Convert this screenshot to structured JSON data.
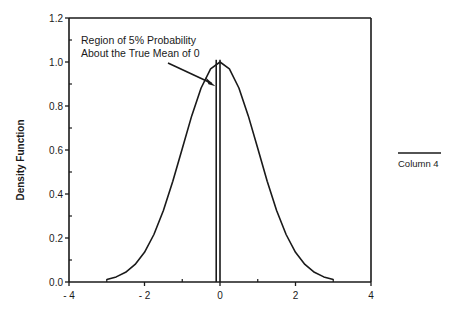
{
  "chart_data": {
    "type": "line",
    "title": "",
    "xlabel": "",
    "ylabel": "Density   Function",
    "xlim": [
      -4,
      4
    ],
    "ylim": [
      0.0,
      1.2
    ],
    "xticks": [
      -4,
      -2,
      0,
      2,
      4
    ],
    "xtick_labels": [
      "- 4",
      "- 2",
      "0",
      "2",
      "4"
    ],
    "yticks": [
      0.0,
      0.2,
      0.4,
      0.6,
      0.8,
      1.0,
      1.2
    ],
    "ytick_labels": [
      "0.0",
      "0.2",
      "0.4",
      "0.6",
      "0.8",
      "1.0",
      "1.2"
    ],
    "grid": false,
    "legend": {
      "position": "right",
      "entries": [
        "Column 4"
      ]
    },
    "series": [
      {
        "name": "Column 4",
        "x": [
          -3.0,
          -2.75,
          -2.5,
          -2.25,
          -2.0,
          -1.75,
          -1.5,
          -1.25,
          -1.0,
          -0.75,
          -0.5,
          -0.25,
          0.0,
          0.25,
          0.5,
          0.75,
          1.0,
          1.25,
          1.5,
          1.75,
          2.0,
          2.25,
          2.5,
          2.75,
          3.0
        ],
        "y": [
          0.011,
          0.023,
          0.044,
          0.08,
          0.135,
          0.216,
          0.325,
          0.458,
          0.607,
          0.755,
          0.882,
          0.969,
          1.0,
          0.969,
          0.882,
          0.755,
          0.607,
          0.458,
          0.325,
          0.216,
          0.135,
          0.08,
          0.044,
          0.023,
          0.011
        ]
      }
    ],
    "region_lines_x": [
      -0.1,
      0.0
    ],
    "annotations": [
      {
        "text_lines": [
          "Region of 5% Probability",
          "About the True Mean of 0"
        ],
        "arrow_to": [
          -0.12,
          0.89
        ]
      }
    ]
  }
}
